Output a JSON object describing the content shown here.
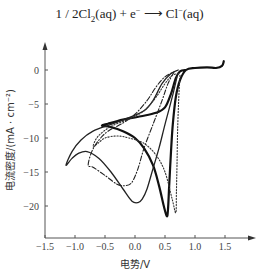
{
  "equation": {
    "lhs_coeff": "1 / 2Cl",
    "lhs_sub": "2",
    "lhs_rest": "(aq) + e",
    "electron_sup": "−",
    "arrow": "⟶",
    "rhs": "Cl",
    "rhs_sup": "−",
    "rhs_rest": "(aq)"
  },
  "chart_data": {
    "type": "line",
    "xlabel": "电势/V",
    "ylabel": "电流密度/(mA · cm⁻²)",
    "xlim": [
      -1.5,
      1.9
    ],
    "ylim": [
      -24,
      5
    ],
    "x_ticks": [
      -1.5,
      -1.0,
      -0.5,
      0.0,
      0.5,
      1.0,
      1.5
    ],
    "x_tick_labels": [
      "−1.5",
      "−1.0",
      "−0.5",
      "0.0",
      "0.5",
      "1.0",
      "1.5"
    ],
    "y_ticks": [
      0,
      -5,
      -10,
      -15,
      -20
    ],
    "y_tick_labels": [
      "0",
      "−5",
      "−10",
      "−15",
      "−20"
    ],
    "grid": false,
    "legend": "none",
    "series": [
      {
        "name": "thick-solid",
        "style": "solid-thick",
        "points": [
          [
            1.48,
            1.3
          ],
          [
            1.45,
            0.6
          ],
          [
            1.35,
            0.3
          ],
          [
            1.2,
            0.4
          ],
          [
            1.0,
            0.3
          ],
          [
            0.85,
            0.0
          ],
          [
            0.75,
            -1.5
          ],
          [
            0.68,
            -4.0
          ],
          [
            0.63,
            -8.0
          ],
          [
            0.6,
            -12.0
          ],
          [
            0.57,
            -17.0
          ],
          [
            0.55,
            -20.5
          ],
          [
            0.53,
            -21.5
          ],
          [
            0.48,
            -20.0
          ],
          [
            0.4,
            -17.0
          ],
          [
            0.3,
            -14.0
          ],
          [
            0.15,
            -11.5
          ],
          [
            0.0,
            -10.0
          ],
          [
            -0.2,
            -9.0
          ],
          [
            -0.4,
            -8.4
          ],
          [
            -0.55,
            -8.2
          ],
          [
            -0.45,
            -7.9
          ],
          [
            -0.2,
            -7.3
          ],
          [
            0.1,
            -6.8
          ],
          [
            0.35,
            -6.3
          ],
          [
            0.5,
            -5.5
          ],
          [
            0.6,
            -3.5
          ],
          [
            0.68,
            -1.2
          ],
          [
            0.75,
            -0.2
          ],
          [
            0.85,
            0.0
          ]
        ]
      },
      {
        "name": "thin-solid",
        "style": "solid-thin",
        "points": [
          [
            0.7,
            -1.0
          ],
          [
            0.62,
            -4.0
          ],
          [
            0.5,
            -8.0
          ],
          [
            0.4,
            -11.5
          ],
          [
            0.3,
            -14.5
          ],
          [
            0.2,
            -17.5
          ],
          [
            0.12,
            -19.0
          ],
          [
            0.05,
            -19.5
          ],
          [
            -0.05,
            -19.3
          ],
          [
            -0.2,
            -17.5
          ],
          [
            -0.4,
            -15.0
          ],
          [
            -0.6,
            -13.0
          ],
          [
            -0.8,
            -12.0
          ],
          [
            -0.95,
            -12.3
          ],
          [
            -1.05,
            -13.0
          ],
          [
            -1.15,
            -14.0
          ],
          [
            -1.05,
            -12.0
          ],
          [
            -0.9,
            -10.3
          ],
          [
            -0.7,
            -9.0
          ],
          [
            -0.4,
            -8.0
          ],
          [
            -0.1,
            -7.0
          ],
          [
            0.15,
            -6.0
          ],
          [
            0.3,
            -4.5
          ],
          [
            0.45,
            -2.0
          ],
          [
            0.6,
            -0.5
          ],
          [
            0.72,
            0.0
          ]
        ]
      },
      {
        "name": "dash-dot",
        "style": "dash-dot",
        "points": [
          [
            0.65,
            -0.3
          ],
          [
            0.55,
            -2.0
          ],
          [
            0.45,
            -4.5
          ],
          [
            0.3,
            -8.0
          ],
          [
            0.15,
            -11.5
          ],
          [
            0.05,
            -14.5
          ],
          [
            -0.05,
            -16.5
          ],
          [
            -0.15,
            -17.0
          ],
          [
            -0.3,
            -16.8
          ],
          [
            -0.5,
            -15.5
          ],
          [
            -0.7,
            -14.3
          ],
          [
            -0.78,
            -14.0
          ],
          [
            -0.72,
            -12.0
          ],
          [
            -0.6,
            -10.3
          ],
          [
            -0.45,
            -9.0
          ],
          [
            -0.2,
            -7.8
          ],
          [
            0.0,
            -6.5
          ],
          [
            0.2,
            -4.5
          ],
          [
            0.35,
            -2.5
          ],
          [
            0.5,
            -1.0
          ],
          [
            0.65,
            -0.3
          ]
        ]
      },
      {
        "name": "dotted",
        "style": "dotted",
        "points": [
          [
            0.75,
            -0.8
          ],
          [
            0.73,
            -4.0
          ],
          [
            0.71,
            -9.0
          ],
          [
            0.7,
            -14.0
          ],
          [
            0.69,
            -18.0
          ],
          [
            0.68,
            -21.0
          ],
          [
            0.62,
            -19.0
          ],
          [
            0.5,
            -15.0
          ],
          [
            0.35,
            -12.5
          ],
          [
            0.15,
            -10.8
          ],
          [
            -0.1,
            -10.0
          ],
          [
            -0.3,
            -9.7
          ],
          [
            -0.5,
            -10.0
          ],
          [
            -0.62,
            -10.8
          ],
          [
            -0.7,
            -11.3
          ],
          [
            -0.62,
            -9.8
          ],
          [
            -0.4,
            -8.3
          ],
          [
            -0.1,
            -7.2
          ],
          [
            0.15,
            -6.0
          ],
          [
            0.35,
            -4.0
          ],
          [
            0.5,
            -2.0
          ],
          [
            0.62,
            -0.8
          ],
          [
            0.75,
            -0.5
          ]
        ]
      }
    ]
  }
}
